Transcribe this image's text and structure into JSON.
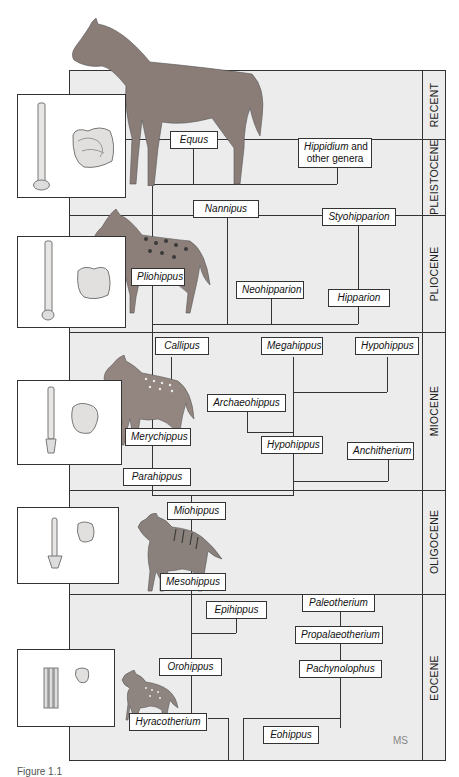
{
  "diagram": {
    "epochs": [
      {
        "name": "RECENT",
        "top": 70,
        "bottom": 139
      },
      {
        "name": "PLEISTOCENE",
        "top": 139,
        "bottom": 215
      },
      {
        "name": "PLIOCENE",
        "top": 215,
        "bottom": 332
      },
      {
        "name": "MIOCENE",
        "top": 332,
        "bottom": 490
      },
      {
        "name": "OLIGOCENE",
        "top": 490,
        "bottom": 594
      },
      {
        "name": "EOCENE",
        "top": 594,
        "bottom": 761
      }
    ],
    "genera": {
      "equus": "Equus",
      "hippidium": "Hippidium",
      "hippidium_suffix": " and",
      "hippidium_line2": "other genera",
      "nannipus": "Nannipus",
      "styohipparion": "Styohipparion",
      "pliohippus": "Pliohippus",
      "neohipparion": "Neohipparion",
      "hipparion": "Hipparion",
      "callipus": "Callipus",
      "megahippus": "Megahippus",
      "hypohippus_top": "Hypohippus",
      "archaeohippus": "Archaeohippus",
      "merychippus": "Merychippus",
      "hypohippus_mid": "Hypohippus",
      "anchitherium": "Anchitherium",
      "parahippus": "Parahippus",
      "miohippus": "Miohippus",
      "mesohippus": "Mesohippus",
      "epihippus": "Epihippus",
      "paleotherium": "Paleotherium",
      "propalaeotherium": "Propalaeotherium",
      "orohippus": "Orohippus",
      "pachynolophus": "Pachynolophus",
      "hyracotherium": "Hyracotherium",
      "eohippus": "Eohippus"
    },
    "insets": [
      "recent-foot-and-tooth",
      "pliocene-foot-and-tooth",
      "miocene-foot-and-tooth",
      "oligocene-foot-and-tooth",
      "eocene-foot-and-tooth"
    ],
    "signature": "MS",
    "caption": "Figure 1.1"
  }
}
